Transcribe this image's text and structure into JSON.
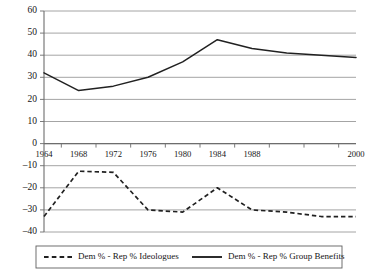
{
  "chart_data": {
    "type": "line",
    "title": "",
    "subtitle": "",
    "xlabel": "",
    "ylabel": "",
    "x": [
      1964,
      1968,
      1972,
      1976,
      1980,
      1984,
      1988,
      1992,
      1996,
      2000
    ],
    "categories": [
      "1964",
      "1968",
      "1972",
      "1976",
      "1980",
      "1984",
      "1988",
      "1992",
      "1996",
      "2000"
    ],
    "xtick_labels": [
      "1964",
      "1968",
      "1972",
      "1976",
      "1980",
      "1984",
      "1988",
      "",
      "",
      "2000"
    ],
    "ytick_labels": [
      "60",
      "50",
      "40",
      "30",
      "20",
      "10",
      "0",
      "–10",
      "–20",
      "–30",
      "–40"
    ],
    "ytick_values": [
      60,
      50,
      40,
      30,
      20,
      10,
      0,
      -10,
      -20,
      -30,
      -40
    ],
    "ylim": [
      -40,
      60
    ],
    "xlim": [
      1964,
      2000
    ],
    "grid": "horizontal",
    "legend_position": "bottom",
    "series": [
      {
        "name": "Dem % - Rep % Ideologues",
        "style": "dashed",
        "color": "#212121",
        "values": [
          -33,
          -12.5,
          -13,
          -30,
          -31,
          -20,
          -30,
          -31,
          -33,
          -33
        ]
      },
      {
        "name": "Dem % - Rep % Group Benefits",
        "style": "solid",
        "color": "#212121",
        "values": [
          32,
          24,
          26,
          30,
          37,
          47,
          43,
          41,
          40,
          39
        ]
      }
    ]
  },
  "legend": {
    "items": [
      {
        "label": "Dem % - Rep % Ideologues",
        "style": "dashed"
      },
      {
        "label": "Dem % - Rep % Group Benefits",
        "style": "solid"
      }
    ]
  }
}
